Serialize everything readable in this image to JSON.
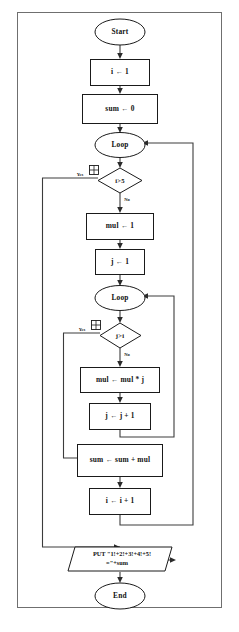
{
  "diagram": {
    "type": "flowchart",
    "colors": {
      "background": "#ffffff",
      "stroke": "#1a1a1a",
      "edge": "#3c3c3c",
      "frame": "#6f6f6f",
      "text": "#111111"
    },
    "nodes": {
      "start": {
        "label": "Start",
        "shape": "terminator"
      },
      "init_i": {
        "label": "i ← 1",
        "shape": "process"
      },
      "init_sum": {
        "label": "sum ← 0",
        "shape": "process"
      },
      "outer_loop": {
        "label": "Loop",
        "shape": "connector"
      },
      "outer_cond": {
        "label": "i>5",
        "shape": "decision"
      },
      "init_mul": {
        "label": "mul ← 1",
        "shape": "process"
      },
      "init_j": {
        "label": "j ← 1",
        "shape": "process"
      },
      "inner_loop": {
        "label": "Loop",
        "shape": "connector"
      },
      "inner_cond": {
        "label": "j>i",
        "shape": "decision"
      },
      "mul_update": {
        "label": "mul ← mul * j",
        "shape": "process"
      },
      "j_update": {
        "label": "j ← j + 1",
        "shape": "process"
      },
      "sum_update": {
        "label": "sum ← sum + mul",
        "shape": "process"
      },
      "i_update": {
        "label": "i ← i + 1",
        "shape": "process"
      },
      "output": {
        "shape": "input-output",
        "line1": "PUT \"1!+2!+3!+4!+5!",
        "line2": "=\"+sum"
      },
      "end": {
        "label": "End",
        "shape": "terminator"
      }
    },
    "edge_labels": {
      "outer_yes": "Yes",
      "outer_no": "No",
      "inner_yes": "Yes",
      "inner_no": "No"
    }
  }
}
